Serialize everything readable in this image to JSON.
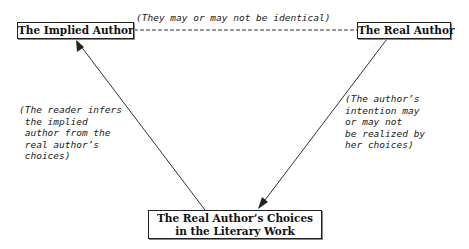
{
  "nodes": {
    "implied_author": "The Implied Author",
    "real_author": "The Real Author",
    "choices_line1": "The Real Author’s Choices",
    "choices_line2": "in the Literary Work"
  },
  "annotations": {
    "top": "(They may or may not be identical)",
    "left": "(The reader infers\n the implied\n author from the\n real author’s\n choices)",
    "right": "(The author’s\nintention may\nor may not\nbe realized by\nher choices)"
  },
  "edges": [
    {
      "from": "implied_author",
      "to": "real_author",
      "style": "dashed",
      "label": "annotations.top"
    },
    {
      "from": "choices",
      "to": "implied_author",
      "style": "arrow",
      "label": "annotations.left"
    },
    {
      "from": "real_author",
      "to": "choices",
      "style": "arrow",
      "label": "annotations.right"
    }
  ]
}
